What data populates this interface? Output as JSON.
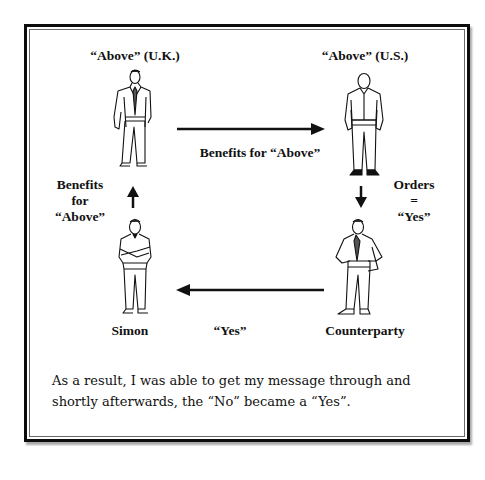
{
  "diagram": {
    "nodes": {
      "above_uk": {
        "label": "“Above” (U.K.)"
      },
      "above_us": {
        "label": "“Above” (U.S.)"
      },
      "simon": {
        "label": "Simon"
      },
      "counterparty": {
        "label": "Counterparty"
      }
    },
    "edges": {
      "uk_to_us": {
        "label": "Benefits for “Above”"
      },
      "simon_to_uk": {
        "line1": "Benefits",
        "line2": "for",
        "line3": "“Above”"
      },
      "us_to_counterparty": {
        "line1": "Orders",
        "line2": "=",
        "line3": "“Yes”"
      },
      "counterparty_to_simon": {
        "label": "“Yes”"
      }
    },
    "icons": {
      "above_uk": "businessman-in-suit-with-tie-icon",
      "above_us": "man-in-shirt-hands-in-pockets-icon",
      "simon": "man-arms-crossed-icon",
      "counterparty": "man-in-jacket-hands-on-hips-icon"
    }
  },
  "caption": {
    "text": "As a result, I was able to get my message through and shortly afterwards, the “No” became a “Yes”."
  }
}
